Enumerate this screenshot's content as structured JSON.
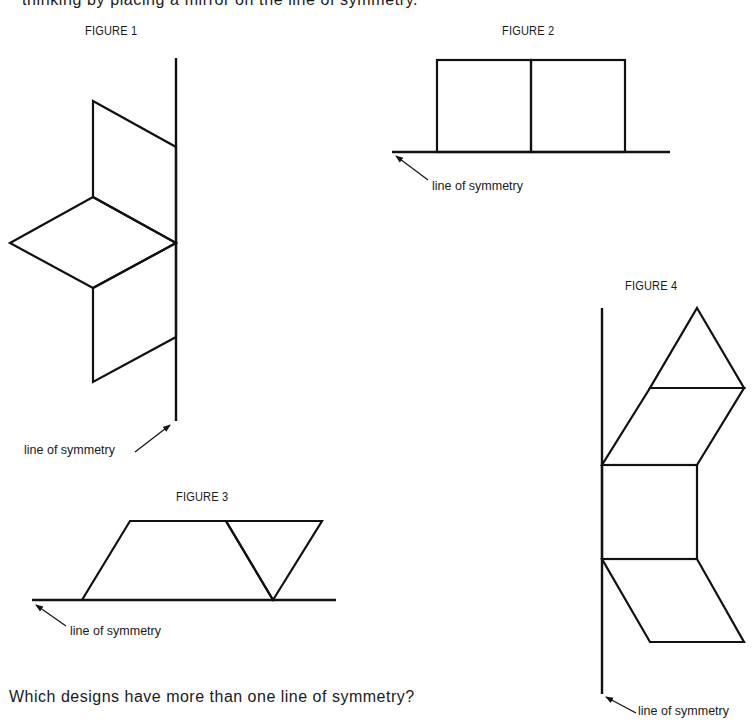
{
  "intro_text": "thinking by placing a mirror on the line of symmetry.",
  "figures": [
    {
      "title": "FIGURE 1",
      "symmetry_label": "line of symmetry",
      "axis": "vertical"
    },
    {
      "title": "FIGURE 2",
      "symmetry_label": "line of symmetry",
      "axis": "horizontal"
    },
    {
      "title": "FIGURE 3",
      "symmetry_label": "line of symmetry",
      "axis": "horizontal"
    },
    {
      "title": "FIGURE 4",
      "symmetry_label": "line of symmetry",
      "axis": "vertical"
    }
  ],
  "question": "Which designs have more than one line of symmetry?",
  "colors": {
    "stroke": "#111111",
    "background": "#ffffff"
  }
}
